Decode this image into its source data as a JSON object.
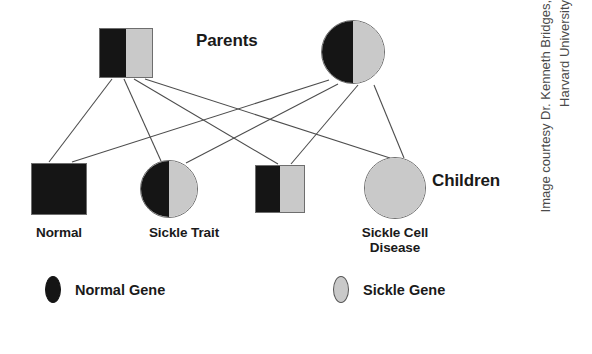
{
  "figure": {
    "title_parents": "Parents",
    "title_children": "Children"
  },
  "colors": {
    "normal_gene": "#151515",
    "sickle_gene": "#c9c9c9",
    "outline": "#6e6e6e",
    "text": "#1a1a1a",
    "credit_text": "#4a4a4a",
    "background": "#ffffff"
  },
  "parents": [
    {
      "id": "father",
      "shape": "square",
      "label": "",
      "genotype": [
        "normal",
        "sickle"
      ],
      "x": 99,
      "y": 28,
      "w": 54,
      "h": 50
    },
    {
      "id": "mother",
      "shape": "circle",
      "label": "",
      "genotype": [
        "normal",
        "sickle"
      ],
      "x": 321,
      "y": 20,
      "w": 64,
      "h": 64
    }
  ],
  "children": [
    {
      "id": "child-normal",
      "shape": "square",
      "label": "Normal",
      "genotype": [
        "normal",
        "normal"
      ],
      "x": 31,
      "y": 163,
      "w": 56,
      "h": 52,
      "label_x": 18,
      "label_y": 225,
      "label_w": 82
    },
    {
      "id": "child-sickle-trait",
      "shape": "circle",
      "label": "Sickle Trait",
      "genotype": [
        "normal",
        "sickle"
      ],
      "x": 140,
      "y": 160,
      "w": 58,
      "h": 58,
      "label_x": 128,
      "label_y": 225,
      "label_w": 112
    },
    {
      "id": "child-sickle-trait-2",
      "shape": "square",
      "label": "",
      "genotype": [
        "normal",
        "sickle"
      ],
      "x": 255,
      "y": 165,
      "w": 50,
      "h": 48,
      "label_x": 0,
      "label_y": 0,
      "label_w": 0
    },
    {
      "id": "child-sickle-cell-disease",
      "shape": "circle",
      "label": "Sickle Cell Disease",
      "genotype": [
        "sickle",
        "sickle"
      ],
      "x": 364,
      "y": 157,
      "w": 62,
      "h": 62,
      "label_x": 337,
      "label_y": 225,
      "label_w": 116
    }
  ],
  "connections": [
    {
      "from": "father",
      "to": "child-normal",
      "x1": 112,
      "y1": 79,
      "x2": 49,
      "y2": 162
    },
    {
      "from": "father",
      "to": "child-sickle-trait",
      "x1": 124,
      "y1": 79,
      "x2": 161,
      "y2": 161
    },
    {
      "from": "father",
      "to": "child-sickle-trait-2",
      "x1": 134,
      "y1": 79,
      "x2": 278,
      "y2": 164
    },
    {
      "from": "father",
      "to": "child-sickle-cell-disease",
      "x1": 145,
      "y1": 79,
      "x2": 390,
      "y2": 158
    },
    {
      "from": "mother",
      "to": "child-normal",
      "x1": 329,
      "y1": 80,
      "x2": 72,
      "y2": 162
    },
    {
      "from": "mother",
      "to": "child-sickle-trait",
      "x1": 338,
      "y1": 84,
      "x2": 186,
      "y2": 163
    },
    {
      "from": "mother",
      "to": "child-sickle-trait-2",
      "x1": 358,
      "y1": 85,
      "x2": 291,
      "y2": 164
    },
    {
      "from": "mother",
      "to": "child-sickle-cell-disease",
      "x1": 374,
      "y1": 85,
      "x2": 404,
      "y2": 158
    }
  ],
  "labels": {
    "parents": {
      "text": "Parents",
      "x": 196,
      "y": 31
    },
    "children": {
      "text": "Children",
      "x": 432,
      "y": 171
    }
  },
  "legend": {
    "items": [
      {
        "glyph": "normal-gene-ellipse",
        "label": "Normal Gene",
        "x": 45,
        "y": 14
      },
      {
        "glyph": "sickle-gene-ellipse",
        "label": "Sickle Gene",
        "x": 333,
        "y": 14
      }
    ]
  },
  "credit": {
    "line1": "Image courtesy Dr. Kenneth Bridges,",
    "line2": "Harvard University"
  }
}
